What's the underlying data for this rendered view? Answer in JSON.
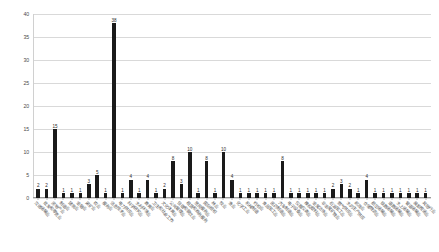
{
  "chart_data": {
    "type": "bar",
    "title": "",
    "subtitle": "",
    "xlabel": "",
    "ylabel": "",
    "ylim": [
      0,
      40
    ],
    "yticks": [
      0,
      5,
      10,
      15,
      20,
      25,
      30,
      35,
      40
    ],
    "grid": true,
    "legend": "none",
    "bar_color": "#1a1a1a",
    "gridline_color": "#d9d9d9",
    "show_value_labels": true,
    "categories": [
      "交通运输业",
      "批发和零售业",
      "房地产业",
      "制造业",
      "建筑业",
      "金融业",
      "采矿业",
      "农业",
      "服务业",
      "信息技术业",
      "电力供应业",
      "科学研究业",
      "水利环境业",
      "教育业",
      "卫生和社会工作",
      "文化体育业",
      "公共管理业",
      "住宿和餐饮业",
      "租赁和商务服务",
      "居民服务业",
      "国际组织",
      "林业",
      "牧业",
      "渔业",
      "化学工业",
      "机械制造",
      "纺织业",
      "食品加工业",
      "医药制造业",
      "汽车制造业",
      "电子设备业",
      "仪器仪表业",
      "橡胶塑料业",
      "金属冶炼业",
      "非金属矿物业",
      "石油加工业",
      "燃气供应业",
      "水的生产供应",
      "邮政业",
      "仓储物流业",
      "航空运输业",
      "铁路运输业",
      "道路运输业",
      "水上运输业",
      "管道运输业",
      "装卸搬运业",
      "其他行业"
    ],
    "values": [
      2,
      2,
      15,
      1,
      1,
      1,
      3,
      5,
      1,
      38,
      1,
      4,
      1,
      4,
      1,
      2,
      8,
      3,
      10,
      1,
      8,
      1,
      10,
      4,
      1,
      1,
      1,
      1,
      1,
      8,
      1,
      1,
      1,
      1,
      1,
      2,
      3,
      2,
      1,
      4,
      1,
      1,
      1,
      1,
      1,
      1,
      1
    ]
  }
}
